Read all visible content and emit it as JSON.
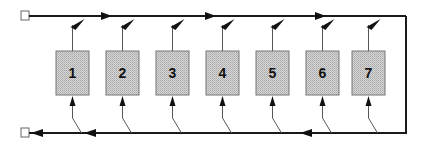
{
  "diagram": {
    "type": "ring-bus-diagram",
    "colors": {
      "line": "#1a1a1a",
      "thin_line": "#555555",
      "box_fill": "#c9c9c9",
      "box_stroke": "#777777",
      "terminal_stroke": "#666666"
    },
    "top_bus": {
      "direction": "left-to-right",
      "y": 16
    },
    "bottom_bus": {
      "direction": "right-to-left",
      "y": 133
    },
    "terminals": [
      {
        "id": "top-terminal",
        "position": "top-left"
      },
      {
        "id": "bottom-terminal",
        "position": "bottom-left"
      }
    ],
    "nodes": [
      {
        "label": "1",
        "x": 56
      },
      {
        "label": "2",
        "x": 106
      },
      {
        "label": "3",
        "x": 156
      },
      {
        "label": "4",
        "x": 206
      },
      {
        "label": "5",
        "x": 256
      },
      {
        "label": "6",
        "x": 306
      },
      {
        "label": "7",
        "x": 352
      }
    ]
  }
}
